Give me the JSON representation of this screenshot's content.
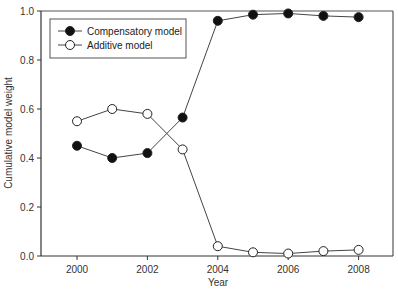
{
  "chart_data": {
    "type": "line",
    "title": "",
    "xlabel": "Year",
    "ylabel": "Cumulative model weight",
    "x": [
      2000,
      2001,
      2002,
      2003,
      2004,
      2005,
      2006,
      2007,
      2008
    ],
    "xlim": [
      1999.1,
      2009.05
    ],
    "ylim": [
      0.0,
      1.0
    ],
    "xticks": [
      2000,
      2002,
      2004,
      2006,
      2008
    ],
    "yticks": [
      0.0,
      0.2,
      0.4,
      0.6,
      0.8,
      1.0
    ],
    "ytick_labels": [
      "0.0",
      "0.2",
      "0.4",
      "0.6",
      "0.8",
      "1.0"
    ],
    "grid": false,
    "legend_position": "upper left",
    "series": [
      {
        "name": "Compensatory model",
        "marker": "filled-circle",
        "color": "#111111",
        "values": [
          0.45,
          0.4,
          0.42,
          0.565,
          0.96,
          0.985,
          0.99,
          0.98,
          0.975
        ]
      },
      {
        "name": "Additive model",
        "marker": "open-circle",
        "color": "#111111",
        "values": [
          0.55,
          0.6,
          0.58,
          0.435,
          0.04,
          0.015,
          0.01,
          0.02,
          0.025
        ]
      }
    ]
  }
}
